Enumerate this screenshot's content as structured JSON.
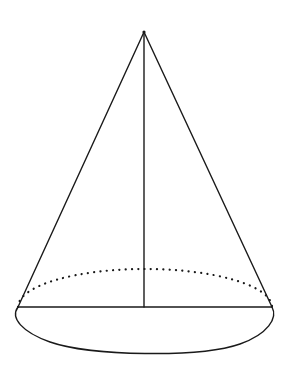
{
  "diagram": {
    "type": "geometry-figure",
    "labels": [],
    "elements": [
      {
        "id": "slant-left",
        "kind": "solid-line",
        "meaning": "left slant edge (generatrix)"
      },
      {
        "id": "slant-right",
        "kind": "solid-line",
        "meaning": "right slant edge (generatrix)"
      },
      {
        "id": "height",
        "kind": "solid-line",
        "meaning": "axis / height from apex to base center"
      },
      {
        "id": "diameter",
        "kind": "solid-line",
        "meaning": "base diameter"
      },
      {
        "id": "base-front",
        "kind": "solid-arc",
        "meaning": "visible front half of base ellipse"
      },
      {
        "id": "base-back",
        "kind": "dotted-arc",
        "meaning": "hidden back half of base ellipse"
      }
    ],
    "colors": {
      "line": "#1a1a1a",
      "background": "#ffffff"
    }
  }
}
